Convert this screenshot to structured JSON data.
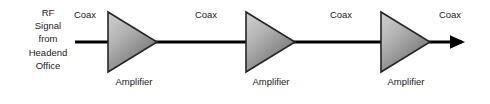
{
  "diagram": {
    "canvas": {
      "width": 490,
      "height": 104,
      "background": "#ffffff"
    },
    "colors": {
      "line": "#000000",
      "text": "#1a1a1a",
      "amplifier_outline": "#262626",
      "amplifier_fill_light": "#c8c8c8",
      "amplifier_fill_dark": "#6e6e6e"
    },
    "source": {
      "name": "headend-source",
      "lines": [
        "RF",
        "Signal",
        "from",
        "Headend",
        "Office"
      ],
      "text": "RF Signal from Headend Office"
    },
    "segments": [
      {
        "id": "coax-1",
        "label": "Coax",
        "x": 62,
        "width": 46
      },
      {
        "id": "coax-2",
        "label": "Coax",
        "x": 183,
        "width": 46
      },
      {
        "id": "coax-3",
        "label": "Coax",
        "x": 318,
        "width": 46
      },
      {
        "id": "coax-4",
        "label": "Coax",
        "x": 427,
        "width": 46
      }
    ],
    "amplifiers": [
      {
        "id": "amplifier-1",
        "label": "Amplifier",
        "x": 107,
        "y": 12,
        "width": 50,
        "height": 60,
        "label_x": 94
      },
      {
        "id": "amplifier-2",
        "label": "Amplifier",
        "x": 245,
        "y": 12,
        "width": 50,
        "height": 60,
        "label_x": 231
      },
      {
        "id": "amplifier-3",
        "label": "Amplifier",
        "x": 380,
        "y": 12,
        "width": 50,
        "height": 60,
        "label_x": 366
      }
    ],
    "signal_path": {
      "name": "coaxial-signal-line",
      "y": 42,
      "start_x": 75,
      "end_x": 468,
      "stroke_width": 3,
      "arrowhead": "right"
    }
  }
}
